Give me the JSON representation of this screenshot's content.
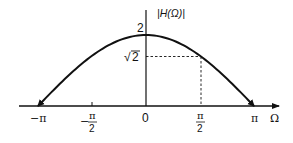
{
  "chart_data": {
    "type": "line",
    "title": "",
    "function": "|H(Ω)| = 2cos(Ω/2)",
    "xlabel": "Ω",
    "ylabel": "|H(Ω)|",
    "x_ticks": [
      {
        "value": -3.14159,
        "label": "−π"
      },
      {
        "value": -1.5708,
        "label": "−π/2"
      },
      {
        "value": 0,
        "label": "0"
      },
      {
        "value": 1.5708,
        "label": "π/2"
      },
      {
        "value": 3.14159,
        "label": "π"
      }
    ],
    "y_ticks": [
      {
        "value": 2,
        "label": "2"
      },
      {
        "value": 1.41421,
        "label": "√2"
      }
    ],
    "series": [
      {
        "name": "|H(Ω)|",
        "x": [
          -3.14159,
          -2.35619,
          -1.5708,
          -0.7854,
          0,
          0.7854,
          1.5708,
          2.35619,
          3.14159
        ],
        "values": [
          0,
          0.765,
          1.414,
          1.848,
          2,
          1.848,
          1.414,
          0.765,
          0
        ]
      }
    ],
    "annotations": [
      {
        "type": "dashed-guide",
        "from": [
          1.5708,
          0
        ],
        "corner": [
          1.5708,
          1.41421
        ],
        "to": [
          0,
          1.41421
        ]
      }
    ],
    "xlim": [
      -3.8,
      3.7
    ],
    "ylim": [
      0,
      2.5
    ],
    "grid": false,
    "legend": "none"
  },
  "labels": {
    "y_axis": "|H(Ω)|",
    "x_axis": "Ω",
    "y_2": "2",
    "y_sqrt2_radical": "√",
    "y_sqrt2_num": "2",
    "x_neg_pi": "−π",
    "x_neg_half_pi_minus": "−",
    "x_neg_half_pi_num": "π",
    "x_neg_half_pi_den": "2",
    "x_zero": "0",
    "x_half_pi_num": "π",
    "x_half_pi_den": "2",
    "x_pi": "π"
  }
}
